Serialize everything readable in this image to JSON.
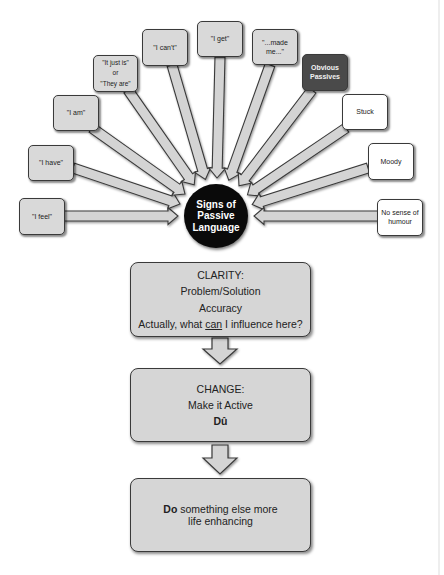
{
  "hub": {
    "lines": [
      "Signs of",
      "Passive",
      "Language"
    ]
  },
  "spokes": [
    {
      "id": "i-feel",
      "lines": [
        "\"I feel\""
      ],
      "style": "grey"
    },
    {
      "id": "i-have",
      "lines": [
        "\"I have\""
      ],
      "style": "grey"
    },
    {
      "id": "i-am",
      "lines": [
        "\"I am\""
      ],
      "style": "grey"
    },
    {
      "id": "it-just-is",
      "lines": [
        "\"It just is\"",
        "or",
        "\"They are\""
      ],
      "style": "grey"
    },
    {
      "id": "i-cant",
      "lines": [
        "\"I can't\""
      ],
      "style": "grey"
    },
    {
      "id": "i-get",
      "lines": [
        "\"I get\""
      ],
      "style": "grey"
    },
    {
      "id": "made-me",
      "lines": [
        "\"...made",
        "me...\""
      ],
      "style": "grey"
    },
    {
      "id": "obvious-passives",
      "lines": [
        "Obvious",
        "Passives"
      ],
      "style": "dark"
    },
    {
      "id": "stuck",
      "lines": [
        "Stuck"
      ],
      "style": "white"
    },
    {
      "id": "moody",
      "lines": [
        "Moody"
      ],
      "style": "white"
    },
    {
      "id": "no-sense-of-humour",
      "lines": [
        "No sense of",
        "humour"
      ],
      "style": "white"
    }
  ],
  "steps": {
    "clarity": {
      "title": "CLARITY:",
      "line1": "Problem/Solution",
      "line2": "Accuracy",
      "line3_pre": "Actually, what ",
      "line3_underlined": "can",
      "line3_post": " I influence here?"
    },
    "change": {
      "title": "CHANGE:",
      "line1": "Make it Active",
      "line2_bold": "Dû"
    },
    "do": {
      "bold": "Do",
      "rest": " something else more life enhancing"
    }
  },
  "colors": {
    "node_fill": "#d9d9d9",
    "node_dark": "#4a4a4a",
    "hub_fill": "#0a0a0a",
    "arrow_fill": "#d4d4d4",
    "outline": "#3a3a3a"
  }
}
